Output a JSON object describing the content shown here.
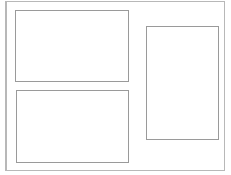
{
  "diagram": {
    "type": "layout-wireframe",
    "frame": {
      "label": "",
      "border_color": "#b8b8b8"
    },
    "panels": [
      {
        "id": "top-left",
        "label": "",
        "orientation": "landscape"
      },
      {
        "id": "bottom-left",
        "label": "",
        "orientation": "landscape"
      },
      {
        "id": "right",
        "label": "",
        "orientation": "portrait"
      }
    ],
    "panel_border_color": "#9a9a9a"
  }
}
